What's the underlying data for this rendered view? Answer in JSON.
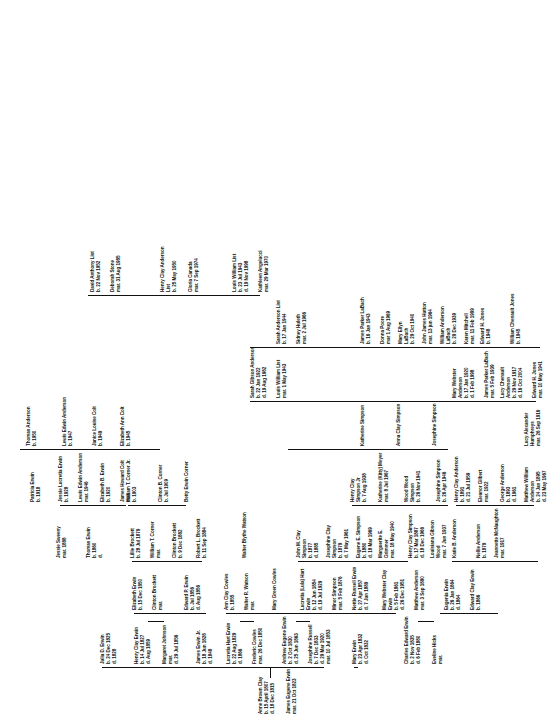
{
  "document": {
    "type": "genealogy-family-tree-chart",
    "orientation": "rotated-90-counterclockwise",
    "root_title": "Erwin / Clay Family Tree"
  },
  "colors": {
    "ink": "#111111",
    "paper": "#ffffff"
  },
  "people": {
    "root_father": {
      "name": "James Eugene Erwin",
      "l1": "mar. 21 Oct 1823",
      "l2": "",
      "l3": ""
    },
    "root_mother": {
      "name": "Anne Brown Clay",
      "l1": "b. 15 April 1807",
      "l2": "d. 18 Dec 1815",
      "l3": ""
    },
    "g2_julia": {
      "name": "Julia D. Erwin",
      "l1": "b. 24 Dec 1825",
      "l2": "d. 1828",
      "l3": ""
    },
    "g2_henry": {
      "name": "Henry Clay Erwin",
      "l1": "b. 14 Jul 1827",
      "l2": "d. Aug 1859",
      "l3": ""
    },
    "g2_henry_sp": {
      "name": "Margaret Johnson",
      "l1": "mar.",
      "l2": "d. 29 Jul 1856",
      "l3": ""
    },
    "g2_jamesjr": {
      "name": "James Erwin Jr.",
      "l1": "b. 18 Jun 1828",
      "l2": "d. 1848",
      "l3": ""
    },
    "g2_lucretia": {
      "name": "Lucretia Hart Erwin",
      "l1": "b. 22 Aug 1829",
      "l2": "d. 1866",
      "l3": ""
    },
    "g2_lucretia_sp": {
      "name": "Frederic Cowles",
      "l1": "mar. 26 Dec 1850",
      "l2": "",
      "l3": ""
    },
    "g2_andrew": {
      "name": "Andrew Eugene Erwin",
      "l1": "b. 2 Oct 1830",
      "l2": "d. 25 Jun 1863",
      "l3": ""
    },
    "g2_andrew_sp": {
      "name": "Josephine Russell",
      "l1": "b. 7 Dec 1833",
      "l2": "d. 29 Mar 1920",
      "l3": "mar. 10 Jul 1853"
    },
    "g2_mary": {
      "name": "Mary Erwin",
      "l1": "b. 23 Apr 1832",
      "l2": "d. Oct 1832",
      "l3": ""
    },
    "g2_charles": {
      "name": "Charles Edward Erwin",
      "l1": "b. 2 Nov 1835",
      "l2": "d. 6 Feb 1880",
      "l3": ""
    },
    "g2_charles_sp": {
      "name": "Eveline Hicks",
      "l1": "mar.",
      "l2": "",
      "l3": ""
    },
    "g3_elizabeth": {
      "name": "Elizabeth Erwin",
      "l1": "b. 15 Dec 1850",
      "l2": "",
      "l3": ""
    },
    "g3_elizabeth_sp": {
      "name": "Clinton Brockett",
      "l1": "mar.",
      "l2": "",
      "l3": ""
    },
    "g3_edwardp": {
      "name": "Edward P. Erwin",
      "l1": "b. Jul 1856",
      "l2": "d. Aug 1856",
      "l3": ""
    },
    "g3_annclay": {
      "name": "Ann Clay Cowles",
      "l1": "b. 1855",
      "l2": "",
      "l3": ""
    },
    "g3_annclay_sp": {
      "name": "Walter R. Watson",
      "l1": "mar.",
      "l2": "",
      "l3": ""
    },
    "g3_marygreen": {
      "name": "Mary Green Cowles",
      "l1": "",
      "l2": "",
      "l3": ""
    },
    "g3_lulahart": {
      "name": "Lucretia (Lula) Hart",
      "l1": "Erwin",
      "l2": "b. 12 Jun 1854",
      "l3": "d. 19 Jul 1929"
    },
    "g3_lulahart_sp": {
      "name": "Minor Simpson",
      "l1": "mar. 5 Feb 1876",
      "l2": "",
      "l3": ""
    },
    "g3_nettie": {
      "name": "Nettie Russell Erwin",
      "l1": "b. 27 Apr 1857",
      "l2": "d. 7 Jun 1889",
      "l3": ""
    },
    "g3_marywebster": {
      "name": "Mary Webster Clay",
      "l1": "Erwin",
      "l2": "b. 5 Feb 1861",
      "l3": "d. 26 Dec 1951"
    },
    "g3_marywebster_sp": {
      "name": "Matthew Anderson",
      "l1": "mar. 3 Sep 1890",
      "l2": "",
      "l3": ""
    },
    "g3_eugenia": {
      "name": "Eugenia Erwin",
      "l1": "b. 26 Jan 1864",
      "l2": "d. 1864",
      "l3": ""
    },
    "g3_edwardclay": {
      "name": "Edward Clay Erwin",
      "l1": "b. 1866",
      "l2": "",
      "l3": ""
    },
    "g3_thomas": {
      "name": "Thomas Erwin",
      "l1": "b. 1860",
      "l2": "d.",
      "l3": ""
    },
    "g3_jessie": {
      "name": "Jessie Sweeny",
      "l1": "mar. 1888",
      "l2": "",
      "l3": ""
    },
    "g3_walterb": {
      "name": "Walter Blythe Watson",
      "l1": "",
      "l2": "",
      "l3": ""
    },
    "g4_lillie": {
      "name": "Lillie Brockett",
      "l1": "b. 28 Jul 1879",
      "l2": "",
      "l3": ""
    },
    "g4_lillie_sp": {
      "name": "William T. Corner",
      "l1": "mar.",
      "l2": "",
      "l3": ""
    },
    "g4_clintonb": {
      "name": "Clinton Brockett",
      "l1": "b. 9 Dec 1882",
      "l2": "",
      "l3": ""
    },
    "g4_robertl": {
      "name": "Robert L. Brockett",
      "l1": "b. 11 Sep 1884",
      "l2": "",
      "l3": ""
    },
    "g4_johnm": {
      "name": "John M. Clay",
      "l1": "Simpson",
      "l2": "b. 1877",
      "l3": "d. 1885"
    },
    "g4_josephineclay": {
      "name": "Josephine Clay",
      "l1": "Simpson",
      "l2": "b. 1879",
      "l3": "d. 7 May 1961"
    },
    "g4_eugenee": {
      "name": "Eugene E. Simpson",
      "l1": "b. 1880",
      "l2": "d. 18 Mar 1969",
      "l3": ""
    },
    "g4_eugenee_sp": {
      "name": "Marguerite E.",
      "l1": "Grimmer",
      "l2": "mar. 18 May 1940",
      "l3": ""
    },
    "g4_henryclaysimp": {
      "name": "Henry Clay Simpson",
      "l1": "b. 17 Mar 1887",
      "l2": "d. 18 Dec 1966",
      "l3": ""
    },
    "g4_louisiana": {
      "name": "Louisiana Gibson",
      "l1": "Wood",
      "l2": "mar. 7 Jun 1937",
      "l3": ""
    },
    "g4_jeannette": {
      "name": "Jeannette McNaughton",
      "l1": "mar. 1917",
      "l2": "",
      "l3": ""
    },
    "g4_nelliea": {
      "name": "Nellie Anderson",
      "l1": "b. 1879",
      "l2": "",
      "l3": ""
    },
    "g4_katieb": {
      "name": "Katie B. Anderson",
      "l1": "",
      "l2": "",
      "l3": ""
    },
    "g4_henryclayand": {
      "name": "Henry Clay Anderson",
      "l1": "b. 1891",
      "l2": "d. 21 Jul 1959",
      "l3": ""
    },
    "g4_henryclayand_sp": {
      "name": "Eleanor Gilbert",
      "l1": "mar. 1922",
      "l2": "",
      "l3": ""
    },
    "g4_georgea": {
      "name": "George Anderson",
      "l1": "b. 1893",
      "l2": "d. 1961",
      "l3": ""
    },
    "g4_matthew": {
      "name": "Matthew William",
      "l1": "Anderson",
      "l2": "b. 24 Jan 1895",
      "l3": "d. 23 May 1967"
    },
    "g4_lucy_alex": {
      "name": "Lucy Alexander",
      "l1": "Humphreys",
      "l2": "mar. 26 Sep 1916",
      "l3": ""
    },
    "g5_williamtcorner": {
      "name": "William T. Corner Jr.",
      "l1": "b. 1903",
      "l2": "",
      "l3": ""
    },
    "g5_clintonbcorner": {
      "name": "Clinton B. Corner",
      "l1": "b. Jul 1909",
      "l2": "",
      "l3": ""
    },
    "g5_bettyerwin": {
      "name": "Betty Erwin Corner",
      "l1": "",
      "l2": "",
      "l3": ""
    },
    "g5_henryclayjr": {
      "name": "Henry Clay",
      "l1": "Simpson Jr",
      "l2": "b. 7 Aug 1938",
      "l3": ""
    },
    "g5_henryclayjr_sp": {
      "name": "Katherine (Kitty) Meyer",
      "l1": "mar. 8 Jul 1967",
      "l2": "",
      "l3": ""
    },
    "g5_woodwood": {
      "name": "Wood Wood",
      "l1": "Simpson",
      "l2": "b. 26 Nov 1941",
      "l3": ""
    },
    "g5_josephinesimp": {
      "name": "Josephine Simpson",
      "l1": "b. 26 Apr 1946",
      "l2": "",
      "l3": ""
    },
    "g5_katherinesimp": {
      "name": "Katherine Simpson",
      "l1": "",
      "l2": "",
      "l3": ""
    },
    "g5_annaclaysimp": {
      "name": "Anna Clay Simpson",
      "l1": "",
      "l2": "",
      "l3": ""
    },
    "g5_josephinesimp2": {
      "name": "Josephine Simpson",
      "l1": "",
      "l2": "",
      "l3": ""
    },
    "g5_patricia": {
      "name": "Patricia Erwin",
      "l1": "b. 1918",
      "l2": "",
      "l3": ""
    },
    "g5_elizabethb": {
      "name": "Elizabeth B. Erwin",
      "l1": "b. 1920",
      "l2": "",
      "l3": ""
    },
    "g5_elizabethb_sp": {
      "name": "James Howard Colt",
      "l1": "mar.",
      "l2": "",
      "l3": ""
    },
    "g5_jessieluc": {
      "name": "Jessie Lucretia Erwin",
      "l1": "b. 1928",
      "l2": "",
      "l3": ""
    },
    "g5_jessieluc_sp": {
      "name": "Lewis Edwin Anderson",
      "l1": "mar. 1946",
      "l2": "",
      "l3": ""
    },
    "g5_lucychenault": {
      "name": "Lucy Chenault",
      "l1": "Anderson",
      "l2": "b. 29 Nov 1917",
      "l3": "d. 16 Oct 2004"
    },
    "g5_lucychenault_sp": {
      "name": "Edward H. Jones",
      "l1": "mar. 10 May 1941",
      "l2": "",
      "l3": ""
    },
    "g5_marywebsterand": {
      "name": "Mary Webster",
      "l1": "Anderson",
      "l2": "b. 17 Jan 1920",
      "l3": "d. 1 Feb 1998"
    },
    "g5_marywebsterand_sp": {
      "name": "James Parker LaBach",
      "l1": "mar. 5 Feb 1939",
      "l2": "",
      "l3": ""
    },
    "g5_sarahgibson": {
      "name": "Sarah Gibson Anderson",
      "l1": "b. 22 Jan 1922",
      "l2": "d. 19 Aug 1982",
      "l3": ""
    },
    "g5_sarahgibson_sp": {
      "name": "Louis William List",
      "l1": "mar. 1 May 1943",
      "l2": "",
      "l3": ""
    },
    "g6_elizabethann": {
      "name": "Elizabeth Ann Colt",
      "l1": "b. 1945",
      "l2": "",
      "l3": ""
    },
    "g6_janicelouise": {
      "name": "Janice Louise Colt",
      "l1": "b. 1949",
      "l2": "",
      "l3": ""
    },
    "g6_lewisedwin": {
      "name": "Lewis Edwin Anderson",
      "l1": "b. 1947",
      "l2": "",
      "l3": ""
    },
    "g6_thomasand": {
      "name": "Thomas Anderson",
      "l1": "b. 1950",
      "l2": "",
      "l3": ""
    },
    "g6_williamchenault": {
      "name": "William Chenault Jones",
      "l1": "b. 1945",
      "l2": "",
      "l3": ""
    },
    "g6_edwardhjones": {
      "name": "Edward H. Jones",
      "l1": "b. 1948",
      "l2": "",
      "l3": ""
    },
    "g6_williamanderson": {
      "name": "William Anderson",
      "l1": "LaBach",
      "l2": "b. 29 Dec 1939",
      "l3": ""
    },
    "g6_williamanderson_sp": {
      "name": "Karen Mitchell",
      "l1": "mar. 11 Feb 1999",
      "l2": "",
      "l3": ""
    },
    "g6_maryellyn": {
      "name": "Mary Ellyn",
      "l1": "LaBach",
      "l2": "b. 29 Oct 1940",
      "l3": ""
    },
    "g6_maryellyn_sp": {
      "name": "John James Hutton",
      "l1": "mar. 13 jun 1964",
      "l2": "",
      "l3": ""
    },
    "g6_jamesparker": {
      "name": "James Parker LaBach",
      "l1": "b. 16 Jan 1943",
      "l2": "",
      "l3": ""
    },
    "g6_jamesparker_sp": {
      "name": "Donna Poore",
      "l1": "mar 1 Aug 1969",
      "l2": "",
      "l3": ""
    },
    "g6_sarahandlist": {
      "name": "Sarah Anderson List",
      "l1": "b. 17 Jan 1944",
      "l2": "",
      "l3": ""
    },
    "g6_sarahandlist_sp": {
      "name": "Sidney Huleth",
      "l1": "mar. 2 Jul 1966",
      "l2": "",
      "l3": ""
    },
    "g6_louiswilliamlist": {
      "name": "Louis William List",
      "l1": "b. 23 Jul 1943",
      "l2": "d. 19 Nov 1998",
      "l3": ""
    },
    "g6_louiswilliamlist_sp": {
      "name": "Kathleen Angelucci",
      "l1": "mar. 29 Mar 1970",
      "l2": "",
      "l3": ""
    },
    "g6_henryclaylist": {
      "name": "Henry Clay Anderson",
      "l1": "List",
      "l2": "b. 25 May 1950",
      "l3": ""
    },
    "g6_henryclaylist_sp": {
      "name": "Gloria Canada",
      "l1": "mar. 7 Sep 1974",
      "l2": "",
      "l3": ""
    },
    "g6_davidanthony": {
      "name": "David Anthony List",
      "l1": "b. 22 Nov 1952",
      "l2": "",
      "l3": ""
    },
    "g6_davidanthony_sp": {
      "name": "Deborah Stone",
      "l1": "mar. 31 Aug 1985",
      "l2": "",
      "l3": ""
    }
  }
}
